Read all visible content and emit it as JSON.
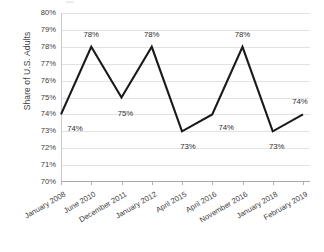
{
  "chart_data": {
    "type": "line",
    "title": "",
    "xlabel": "",
    "ylabel": "Share of U.S. Adults",
    "ylim": [
      70,
      80
    ],
    "ytick_step": 1,
    "grid": true,
    "legend": "none",
    "line_color": "#1a1a1a",
    "gridline_color": "#e2e2e2",
    "categories": [
      "January 2008",
      "June 2010",
      "December 2011",
      "January 2012",
      "April 2015",
      "April 2016",
      "November 2016",
      "January 2018",
      "February 2019"
    ],
    "values": [
      74,
      78,
      75,
      78,
      73,
      74,
      78,
      73,
      74
    ],
    "point_labels": [
      "74%",
      "78%",
      "75%",
      "78%",
      "73%",
      "74%",
      "78%",
      "73%",
      "74%"
    ],
    "ytick_labels": [
      "80%",
      "79%",
      "78%",
      "77%",
      "76%",
      "75%",
      "74%",
      "73%",
      "72%",
      "71%",
      "70%"
    ],
    "ytick_values": [
      80,
      79,
      78,
      77,
      76,
      75,
      74,
      73,
      72,
      71,
      70
    ]
  },
  "axes": {
    "y_title": "Share of U.S. Adults"
  }
}
